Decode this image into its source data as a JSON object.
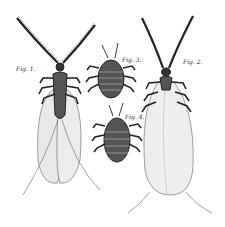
{
  "plate": {
    "description": "Engraved scientific illustration of four insects (two winged, two wingless nymphs)",
    "figures": [
      {
        "id": "fig1",
        "label": "Fig. 1.",
        "type": "winged insect with plumose antennae"
      },
      {
        "id": "fig2",
        "label": "Fig. 2.",
        "type": "winged insect with plumose antennae, wings folded"
      },
      {
        "id": "fig3",
        "label": "Fig. 3.",
        "type": "wingless nymph"
      },
      {
        "id": "fig4",
        "label": "Fig. 4.",
        "type": "wingless nymph"
      }
    ],
    "colors": {
      "ink": "#222222",
      "wing": "#e8e8e6",
      "background": "#ffffff"
    }
  }
}
